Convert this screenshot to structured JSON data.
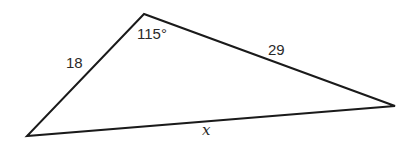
{
  "diagram": {
    "type": "triangle",
    "vertices": {
      "top": [
        144,
        14
      ],
      "left": [
        27,
        136
      ],
      "right": [
        395,
        106
      ]
    },
    "stroke_color": "#1a1a1a",
    "labels": {
      "side_left": "18",
      "side_right": "29",
      "side_bottom": "x",
      "angle_top": "115°"
    }
  }
}
